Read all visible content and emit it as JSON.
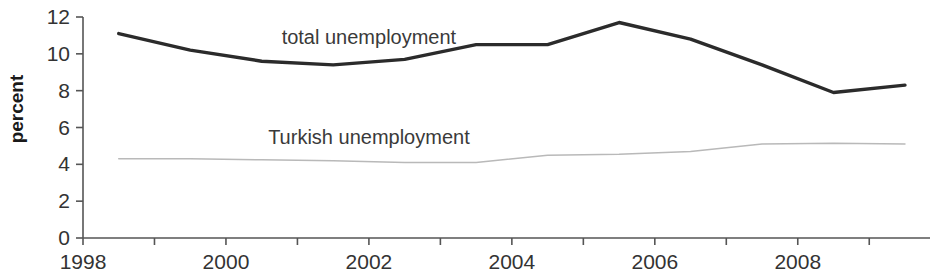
{
  "chart_data": {
    "type": "line",
    "title": "",
    "xlabel": "",
    "ylabel": "percent",
    "xlim": [
      1998.0,
      2009.85
    ],
    "ylim": [
      0,
      12
    ],
    "grid": false,
    "legend_position": "inline-annotation",
    "y_ticks": [
      0,
      2,
      4,
      6,
      8,
      10,
      12
    ],
    "y_tick_labels": [
      "0",
      "2",
      "4",
      "6",
      "8",
      "10",
      "12"
    ],
    "x_ticks": [
      1998,
      1999,
      2000,
      2001,
      2002,
      2003,
      2004,
      2005,
      2006,
      2007,
      2008,
      2009
    ],
    "x_tick_labels_shown": [
      "1998",
      "2000",
      "2002",
      "2004",
      "2006",
      "2008"
    ],
    "x_tick_labels_shown_values": [
      1998,
      2000,
      2002,
      2004,
      2006,
      2008
    ],
    "x": [
      1998.5,
      1999.5,
      2000.5,
      2001.5,
      2002.5,
      2003.5,
      2004.5,
      2005.5,
      2006.5,
      2007.5,
      2008.5,
      2009.5
    ],
    "series": [
      {
        "name": "total unemployment",
        "color": "#2b2b2b",
        "style": "solid-thick",
        "values": [
          11.1,
          10.2,
          9.6,
          9.4,
          9.7,
          10.5,
          10.5,
          11.7,
          10.8,
          9.4,
          7.9,
          8.3
        ]
      },
      {
        "name": "Turkish unemployment",
        "color": "#b9b9b9",
        "style": "solid-thin",
        "values": [
          4.3,
          4.3,
          4.25,
          4.2,
          4.1,
          4.1,
          4.5,
          4.55,
          4.7,
          5.1,
          5.15,
          5.1
        ]
      }
    ],
    "annotations": [
      {
        "text": "total unemployment",
        "x": 2002.0,
        "y": 10.9
      },
      {
        "text": "Turkish unemployment",
        "x": 2002.0,
        "y": 5.5
      }
    ]
  }
}
